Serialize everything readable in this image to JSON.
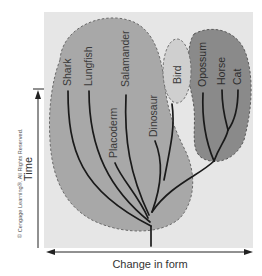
{
  "figure": {
    "colors": {
      "background_panel": "#e6e6e6",
      "fish_group_fill": "#a8a8a8",
      "bird_fill": "#cfcfcf",
      "mammal_fill": "#8a8a8a",
      "branch": "#1a1a1a",
      "border_dash": "#666666"
    },
    "axes": {
      "y_label": "Time",
      "x_label": "Change in form"
    },
    "groups": [
      {
        "name": "fish-reptile-group",
        "taxa": [
          "Shark",
          "Lungfish",
          "Placoderm",
          "Salamander",
          "Dinosaur"
        ]
      },
      {
        "name": "bird-group",
        "taxa": [
          "Bird"
        ]
      },
      {
        "name": "mammal-group",
        "taxa": [
          "Opossum",
          "Horse",
          "Cat"
        ]
      }
    ],
    "taxa": {
      "shark": "Shark",
      "lungfish": "Lungfish",
      "placoderm": "Placoderm",
      "salamander": "Salamander",
      "dinosaur": "Dinosaur",
      "bird": "Bird",
      "opossum": "Opossum",
      "horse": "Horse",
      "cat": "Cat"
    },
    "copyright": "© Cengage Learning®. All Rights Reserved."
  }
}
